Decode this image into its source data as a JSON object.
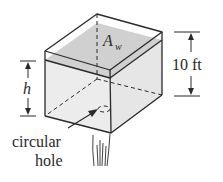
{
  "diagram": {
    "labels": {
      "water_area": "A",
      "water_area_sub": "w",
      "height_var": "h",
      "tank_height": "10 ft",
      "hole_line1": "circular",
      "hole_line2": "hole"
    },
    "colors": {
      "line": "#2a2a2a",
      "water_surface": "#d4d4d4",
      "water_body": "#ececec",
      "background": "#ffffff"
    }
  }
}
